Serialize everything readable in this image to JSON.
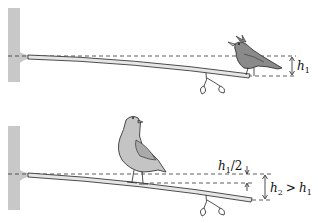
{
  "panels": [
    {
      "id": "top",
      "subject": "small bird (crested) perched near end of branch",
      "label": {
        "var": "h",
        "sub": "1",
        "full": "h1"
      }
    },
    {
      "id": "bottom",
      "subject": "larger bird (pigeon) perched near middle of branch",
      "label_half": {
        "var": "h",
        "sub": "1",
        "suffix": "/2",
        "full": "h1/2"
      },
      "label_total": {
        "var": "h",
        "sub": "2",
        "op": ">",
        "var2": "h",
        "sub2": "1",
        "full": "h2 > h1"
      }
    }
  ],
  "colors": {
    "trunk": "#c8c8c8",
    "branch": "#e6e6e6",
    "outline": "#222222",
    "bird_top": "#8a8a8a",
    "bird_bottom": "#c4c4c4",
    "dashed": "#333333"
  }
}
